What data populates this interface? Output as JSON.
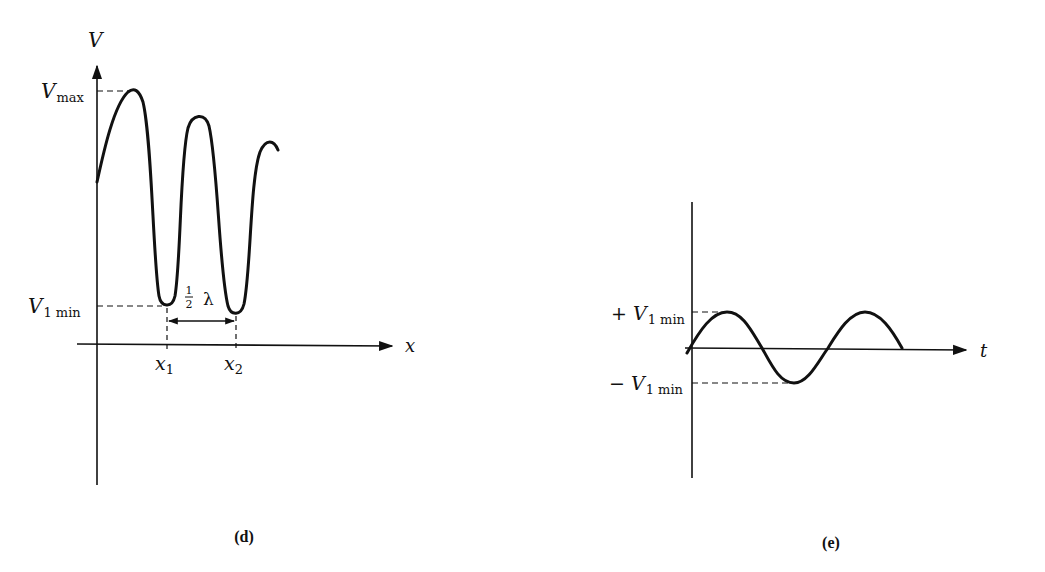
{
  "figures": [
    {
      "id": "d",
      "caption": "(d)",
      "y_axis_label": "V",
      "x_axis_label": "x",
      "level_labels": {
        "vmax": {
          "main": "V",
          "sub": "max"
        },
        "v1min": {
          "main": "V",
          "sub": "1 min"
        }
      },
      "tick_labels": [
        {
          "main": "x",
          "sub": "1"
        },
        {
          "main": "x",
          "sub": "2"
        }
      ],
      "spacing_annotation": {
        "num": "1",
        "den": "2",
        "symbol": "λ"
      }
    },
    {
      "id": "e",
      "caption": "(e)",
      "x_axis_label": "t",
      "level_labels": {
        "pos": {
          "sign": "+",
          "main": "V",
          "sub": "1 min"
        },
        "neg": {
          "sign": "−",
          "main": "V",
          "sub": "1 min"
        }
      }
    }
  ],
  "colors": {
    "ink": "#111111",
    "background": "#ffffff"
  }
}
